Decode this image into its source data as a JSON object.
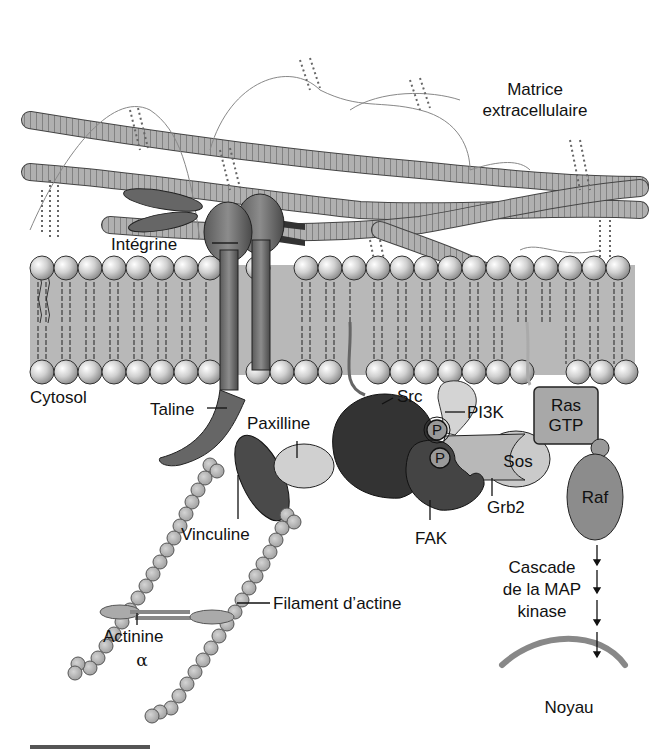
{
  "diagram": {
    "title": "",
    "regions": {
      "ecm": "Matrice",
      "ecm2": "extracellulaire",
      "cytosol": "Cytosol",
      "nucleus": "Noyau"
    },
    "labels": {
      "integrin": "Intégrine",
      "talin": "Taline",
      "paxillin": "Paxilline",
      "vinculin": "Vinculine",
      "src": "Src",
      "pi3k": "PI3K",
      "p1": "P",
      "p2": "P",
      "ras1": "Ras",
      "ras2": "GTP",
      "sos": "Sos",
      "grb2": "Grb2",
      "fak": "FAK",
      "raf": "Raf",
      "actin": "Filament d’actine",
      "actinin1": "Actinine",
      "actinin2": "α",
      "mapk1": "Cascade",
      "mapk2": "de la MAP",
      "mapk3": "kinase"
    },
    "colors": {
      "dark": "#3c3c3c",
      "mid": "#8a8a8a",
      "light": "#c8c8c8",
      "membrane": "#b4b4b4",
      "fiber": "#a8a8a8"
    }
  }
}
